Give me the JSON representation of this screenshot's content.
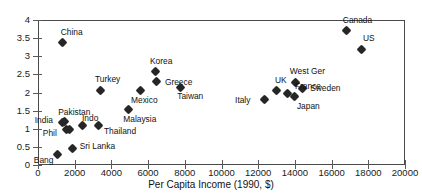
{
  "chart_data": {
    "type": "scatter",
    "title": "",
    "xlabel": "Per Capita Income (1990, $)",
    "ylabel": "",
    "xlim": [
      0,
      20000
    ],
    "ylim": [
      0,
      4
    ],
    "xticks": [
      0,
      2000,
      4000,
      6000,
      8000,
      10000,
      12000,
      14000,
      16000,
      18000,
      20000
    ],
    "xtick_labels": [
      "0",
      "2000",
      "4000",
      "6000",
      "8000",
      "10000",
      "12000",
      "14000",
      "16000",
      "18000",
      "20000"
    ],
    "yticks": [
      0,
      0.5,
      1,
      1.5,
      2,
      2.5,
      3,
      3.5,
      4
    ],
    "ytick_labels": [
      "0",
      "0.5",
      "1",
      "1.5",
      "2",
      "2.5",
      "3",
      "3.5",
      "4"
    ],
    "grid": false,
    "legend": "none",
    "marker": "diamond",
    "marker_color": "#262626",
    "points": [
      {
        "label": "China",
        "x": 1350,
        "y": 3.37,
        "lx": -2,
        "ly": -15
      },
      {
        "label": "Canada",
        "x": 16830,
        "y": 3.7,
        "lx": -4,
        "ly": -15
      },
      {
        "label": "US",
        "x": 17650,
        "y": 3.2,
        "lx": 1,
        "ly": -15
      },
      {
        "label": "West Ger",
        "x": 14050,
        "y": 2.28,
        "lx": -6,
        "ly": -15
      },
      {
        "label": "Sweden",
        "x": 14400,
        "y": 2.12,
        "lx": 8,
        "ly": -4
      },
      {
        "label": "Korea",
        "x": 6430,
        "y": 2.57,
        "lx": -6,
        "ly": -15
      },
      {
        "label": "Greece",
        "x": 6480,
        "y": 2.3,
        "lx": 8,
        "ly": -4
      },
      {
        "label": "Taiwan",
        "x": 7750,
        "y": 2.15,
        "lx": -3,
        "ly": 5
      },
      {
        "label": "Mexico",
        "x": 5560,
        "y": 2.05,
        "lx": -9,
        "ly": 5
      },
      {
        "label": "Turkey",
        "x": 3430,
        "y": 2.06,
        "lx": -6,
        "ly": -15
      },
      {
        "label": "UK",
        "x": 13020,
        "y": 2.06,
        "lx": -2,
        "ly": -14
      },
      {
        "label": "France",
        "x": 13620,
        "y": 1.98,
        "lx": 7,
        "ly": -11
      },
      {
        "label": "Japan",
        "x": 14000,
        "y": 1.88,
        "lx": 2,
        "ly": 5
      },
      {
        "label": "Italy",
        "x": 12320,
        "y": 1.8,
        "lx": -29,
        "ly": -4
      },
      {
        "label": "Malaysia",
        "x": 4920,
        "y": 1.52,
        "lx": -5,
        "ly": 5
      },
      {
        "label": "Pakistan",
        "x": 1430,
        "y": 1.2,
        "lx": -6,
        "ly": -14
      },
      {
        "label": "India",
        "x": 1350,
        "y": 1.18,
        "lx": -28,
        "ly": -6
      },
      {
        "label": "Indo",
        "x": 2400,
        "y": 1.09,
        "lx": 0,
        "ly": -11
      },
      {
        "label": "Thailand",
        "x": 3270,
        "y": 1.08,
        "lx": 6,
        "ly": 1
      },
      {
        "label": "Phil",
        "x": 1570,
        "y": 0.97,
        "lx": -24,
        "ly": -1
      },
      {
        "label": "Phil2",
        "x": 1730,
        "y": 0.97,
        "lx": 0,
        "ly": 0,
        "hide_label": true
      },
      {
        "label": "Sri Lanka",
        "x": 1890,
        "y": 0.46,
        "lx": 7,
        "ly": -6
      },
      {
        "label": "Bang",
        "x": 1080,
        "y": 0.29,
        "lx": -24,
        "ly": 2
      }
    ]
  }
}
